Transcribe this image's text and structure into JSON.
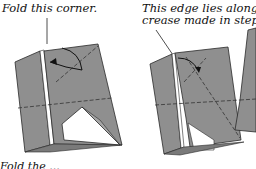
{
  "diagram": {
    "type": "origami-fold-instructions",
    "annotations": [
      {
        "id": "left",
        "text": "Fold this corner."
      },
      {
        "id": "right_line1",
        "text": "This edge lies along the"
      },
      {
        "id": "right_line2",
        "text": "crease made in step 3."
      }
    ],
    "bottom_partial_text": "Fold the ...",
    "colors": {
      "paper": "#8f8f8f",
      "paper_dark": "#7a7a7a",
      "outline": "#2a2a2a",
      "background": "#ffffff"
    },
    "figures": [
      {
        "name": "before-fold",
        "description": "Folded paper with corner to fold, curved arrow indicating fold"
      },
      {
        "name": "after-fold",
        "description": "Result with edge aligned to crease from step 3"
      }
    ]
  }
}
